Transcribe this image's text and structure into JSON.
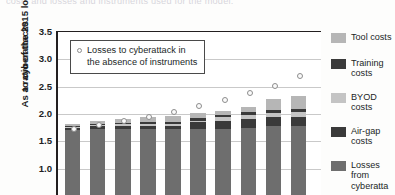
{
  "caption": "costs and losses and instruments used for the model.",
  "chart_data": {
    "type": "bar",
    "stacked": true,
    "title": "",
    "xlabel": "",
    "ylabel": "As a ratio of the 2015 losses to cyberattacks",
    "ylabel_line1": "As a ratio of the 2015 losses",
    "ylabel_line2": "to cyberattacks",
    "ylim": [
      0.5,
      3.5
    ],
    "yticks": [
      "3.5",
      "3.0",
      "2.5",
      "2.0",
      "1.5",
      "1.0"
    ],
    "ytick_values": [
      3.5,
      3.0,
      2.5,
      2.0,
      1.5,
      1.0
    ],
    "grid": true,
    "legend_position": "right",
    "categories": [
      "1",
      "2",
      "3",
      "4",
      "5",
      "6",
      "7",
      "8",
      "9",
      "10"
    ],
    "series": [
      {
        "name": "Losses from cyberattacks",
        "color": "#6e6e6e",
        "values": [
          1.18,
          1.2,
          1.2,
          1.2,
          1.2,
          1.2,
          1.2,
          1.22,
          1.26,
          1.26
        ]
      },
      {
        "name": "Air-gap costs",
        "color": "#3a3a3a",
        "values": [
          0.05,
          0.06,
          0.07,
          0.07,
          0.07,
          0.13,
          0.15,
          0.17,
          0.17,
          0.17
        ]
      },
      {
        "name": "BYOD costs",
        "color": "#c4c4c4",
        "values": [
          0.02,
          0.02,
          0.02,
          0.03,
          0.03,
          0.03,
          0.07,
          0.07,
          0.07,
          0.08
        ]
      },
      {
        "name": "Training costs",
        "color": "#3a3a3a",
        "values": [
          0.02,
          0.02,
          0.03,
          0.03,
          0.03,
          0.04,
          0.04,
          0.05,
          0.06,
          0.06
        ]
      },
      {
        "name": "Tool costs",
        "color": "#b6b6b6",
        "values": [
          0.03,
          0.05,
          0.07,
          0.09,
          0.12,
          0.1,
          0.07,
          0.1,
          0.2,
          0.24
        ]
      }
    ],
    "bar_totals": [
      1.3,
      1.35,
      1.39,
      1.42,
      1.45,
      1.5,
      1.53,
      1.61,
      1.76,
      1.81
    ],
    "scatter": {
      "name": "Losses to cyberattack in the absence of instruments",
      "marker": "open-circle",
      "color": "#8d8d8d",
      "values": [
        1.73,
        1.79,
        1.88,
        1.95,
        2.03,
        2.15,
        2.26,
        2.38,
        2.52,
        2.7,
        2.9
      ]
    },
    "scatter_legend_line1": "Losses to cyberattack in",
    "scatter_legend_line2": "the absence of instruments"
  },
  "legend": {
    "items": [
      {
        "label_line1": "Tool costs",
        "label_line2": "",
        "color": "#b6b6b6"
      },
      {
        "label_line1": "Training",
        "label_line2": "costs",
        "color": "#3a3a3a"
      },
      {
        "label_line1": "BYOD",
        "label_line2": "costs",
        "color": "#c4c4c4"
      },
      {
        "label_line1": "Air-gap",
        "label_line2": "costs",
        "color": "#3a3a3a"
      },
      {
        "label_line1": "Losses",
        "label_line2": "from",
        "label_line3": "cyberatta",
        "color": "#6e6e6e"
      }
    ]
  }
}
